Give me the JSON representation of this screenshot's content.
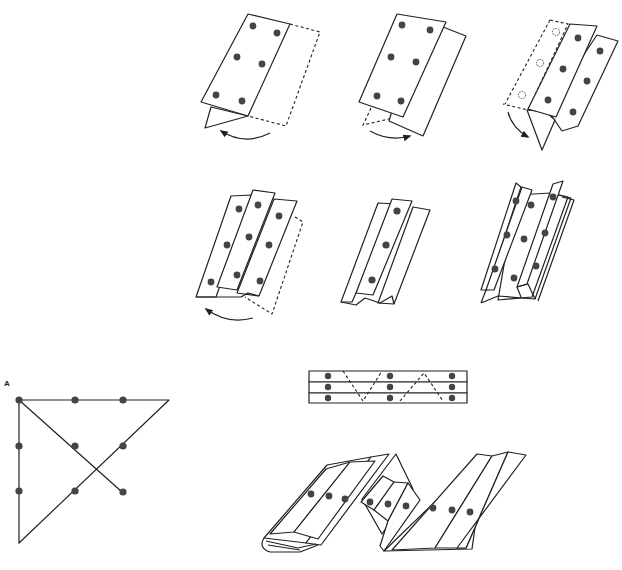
{
  "figure": {
    "type": "paper-folding instruction diagram",
    "steps": [
      {
        "id": "step-1",
        "description": "Fold right panel behind (dashed), bottom flap folds toward left",
        "dots": 6
      },
      {
        "id": "step-2",
        "description": "Two panels visible, lower flap swings right",
        "dots": 6
      },
      {
        "id": "step-3",
        "description": "Left panel folded back (hollow dot outlines), flap folds down",
        "dots": 6,
        "hidden_dots": 3
      },
      {
        "id": "step-4",
        "description": "Three overlapping panels, right panel folds back",
        "dots": 9
      },
      {
        "id": "step-5",
        "description": "Pleated strip with single center column",
        "dots": 3
      },
      {
        "id": "step-6",
        "description": "Pleated stack with multiple layers",
        "dots": 8
      }
    ],
    "zigzag_strip": {
      "rows": 3,
      "dot_columns": 3,
      "description": "Three-row strip with dashed zigzag fold line"
    },
    "accordion": {
      "groups": 3,
      "dots_per_group": 3
    },
    "puzzle": {
      "label": "A",
      "grid": "3x3 dots",
      "description": "Nine-dot puzzle solved with four straight lines"
    }
  },
  "colors": {
    "line": "#222222",
    "dot": "#444444",
    "background": "#ffffff"
  }
}
